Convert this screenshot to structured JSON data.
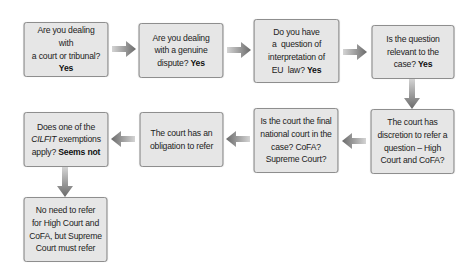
{
  "diagram": {
    "type": "flowchart",
    "colors": {
      "box_fill": "#e6e6e6",
      "box_border": "#8a8a8a",
      "arrow_light": "#c8c8c8",
      "arrow_dark": "#6a6a6a",
      "text": "#222222"
    },
    "nodes": [
      {
        "id": "court-or-tribunal",
        "text_lines": [
          "Are you dealing with",
          "a court or tribunal?"
        ],
        "answer": "Yes"
      },
      {
        "id": "genuine-dispute",
        "text_lines": [
          "Are you dealing",
          "with a genuine",
          "dispute?"
        ],
        "answer": "Yes"
      },
      {
        "id": "interpretation-eu-law",
        "text_lines": [
          "Do you have",
          "a  question of",
          "interpretation of",
          "EU  law?"
        ],
        "answer": "Yes"
      },
      {
        "id": "question-relevant",
        "text_lines": [
          "Is the question",
          "relevant to the",
          "case?"
        ],
        "answer": "Yes"
      },
      {
        "id": "discretion-to-refer",
        "text_lines": [
          "The court has",
          "discretion to refer a",
          "question – High",
          "Court and CoFA?"
        ]
      },
      {
        "id": "final-national-court",
        "text_lines": [
          "Is the court the final",
          "national court in the",
          "case? CoFA?",
          "Supreme Court?"
        ]
      },
      {
        "id": "obligation-to-refer",
        "text_lines": [
          "The court has an",
          "obligation to refer"
        ]
      },
      {
        "id": "cilfit-exemptions",
        "text_prefix": "Does one of the",
        "italic_term": "CILFIT",
        "text_after_italic": "exemptions",
        "text_line3": "apply?",
        "answer": "Seems not"
      },
      {
        "id": "no-need-to-refer",
        "text_lines": [
          "No need to refer",
          "for High Court and",
          "CoFA, but Supreme",
          "Court must refer"
        ]
      }
    ],
    "edges": [
      {
        "from": "court-or-tribunal",
        "to": "genuine-dispute",
        "direction": "right"
      },
      {
        "from": "genuine-dispute",
        "to": "interpretation-eu-law",
        "direction": "right"
      },
      {
        "from": "interpretation-eu-law",
        "to": "question-relevant",
        "direction": "right"
      },
      {
        "from": "question-relevant",
        "to": "discretion-to-refer",
        "direction": "down"
      },
      {
        "from": "discretion-to-refer",
        "to": "final-national-court",
        "direction": "left"
      },
      {
        "from": "final-national-court",
        "to": "obligation-to-refer",
        "direction": "left"
      },
      {
        "from": "obligation-to-refer",
        "to": "cilfit-exemptions",
        "direction": "left"
      },
      {
        "from": "cilfit-exemptions",
        "to": "no-need-to-refer",
        "direction": "down"
      }
    ]
  }
}
